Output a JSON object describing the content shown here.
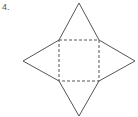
{
  "problem": {
    "number_label": "4."
  },
  "figure": {
    "stroke_color": "#555555",
    "base": {
      "style": "dashed",
      "corners": [
        [
          59,
          40
        ],
        [
          99,
          40
        ],
        [
          99,
          81
        ],
        [
          59,
          81
        ]
      ]
    },
    "triangles": [
      {
        "name": "top",
        "apex": [
          79,
          3
        ]
      },
      {
        "name": "right",
        "apex": [
          135,
          61
        ]
      },
      {
        "name": "bottom",
        "apex": [
          79,
          116
        ]
      },
      {
        "name": "left",
        "apex": [
          23,
          61
        ]
      }
    ]
  }
}
